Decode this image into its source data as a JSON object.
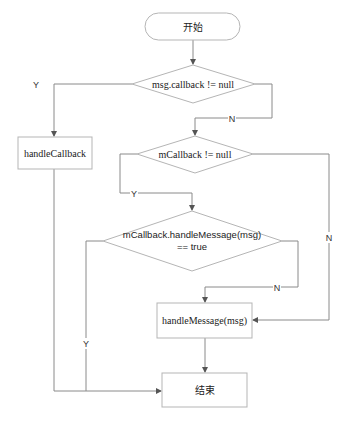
{
  "diagram": {
    "type": "flowchart",
    "nodes": {
      "start": {
        "label": "开始",
        "shape": "terminal"
      },
      "cond_msg_callback": {
        "label": "msg.callback != null",
        "shape": "decision"
      },
      "handle_callback": {
        "label": "handleCallback",
        "shape": "process"
      },
      "cond_mcallback": {
        "label": "mCallback != null",
        "shape": "decision"
      },
      "cond_handle_message": {
        "label_line1": "mCallback.handleMessage(msg)",
        "label_line2": "== true",
        "shape": "decision"
      },
      "handle_message": {
        "label": "handleMessage(msg)",
        "shape": "process"
      },
      "end": {
        "label": "结束",
        "shape": "process"
      }
    },
    "edge_labels": {
      "msg_callback_yes": "Y",
      "msg_callback_no": "N",
      "mcallback_yes": "Y",
      "mcallback_no": "N",
      "handle_message_no": "N",
      "handle_message_yes": "Y"
    },
    "edges": [
      {
        "from": "start",
        "to": "cond_msg_callback"
      },
      {
        "from": "cond_msg_callback",
        "to": "handle_callback",
        "label": "Y"
      },
      {
        "from": "cond_msg_callback",
        "to": "cond_mcallback",
        "label": "N"
      },
      {
        "from": "cond_mcallback",
        "to": "cond_handle_message",
        "label": "Y"
      },
      {
        "from": "cond_mcallback",
        "to": "handle_message",
        "label": "N"
      },
      {
        "from": "cond_handle_message",
        "to": "handle_message",
        "label": "N"
      },
      {
        "from": "cond_handle_message",
        "to": "end",
        "label": "Y"
      },
      {
        "from": "handle_callback",
        "to": "end"
      },
      {
        "from": "handle_message",
        "to": "end"
      }
    ]
  }
}
